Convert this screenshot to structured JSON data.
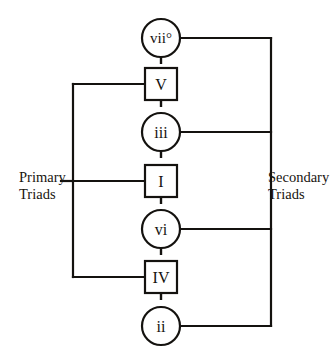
{
  "diagram": {
    "colors": {
      "line": "#14120f",
      "text": "#18150f",
      "background": "#ffffff",
      "node_fill": "#ffffff"
    },
    "nodes": [
      {
        "id": "vii-dim",
        "label": "vii°",
        "shape": "circle",
        "group": "secondary",
        "cx": 161,
        "cy": 38,
        "r": 19
      },
      {
        "id": "V",
        "label": "V",
        "shape": "rectangle",
        "group": "primary",
        "cx": 161,
        "cy": 84,
        "r": 16
      },
      {
        "id": "iii",
        "label": "iii",
        "shape": "circle",
        "group": "secondary",
        "cx": 161,
        "cy": 132,
        "r": 19
      },
      {
        "id": "I",
        "label": "I",
        "shape": "rectangle",
        "group": "primary",
        "cx": 161,
        "cy": 181,
        "r": 16
      },
      {
        "id": "vi",
        "label": "vi",
        "shape": "circle",
        "group": "secondary",
        "cx": 161,
        "cy": 229,
        "r": 19
      },
      {
        "id": "IV",
        "label": "IV",
        "shape": "rectangle",
        "group": "primary",
        "cx": 161,
        "cy": 277,
        "r": 16
      },
      {
        "id": "ii",
        "label": "ii",
        "shape": "circle",
        "group": "secondary",
        "cx": 161,
        "cy": 326,
        "r": 19
      }
    ],
    "connectors": [
      {
        "from": "vii-dim",
        "to": "V",
        "style": "dashed"
      },
      {
        "from": "V",
        "to": "iii",
        "style": "dashed"
      },
      {
        "from": "iii",
        "to": "I",
        "style": "dashed"
      },
      {
        "from": "I",
        "to": "vi",
        "style": "dashed"
      },
      {
        "from": "vi",
        "to": "IV",
        "style": "dashed"
      },
      {
        "from": "IV",
        "to": "ii",
        "style": "dashed"
      }
    ],
    "brackets": [
      {
        "id": "primary-bracket",
        "side": "left",
        "spine_x": 73,
        "top_y": 84,
        "bottom_y": 277,
        "members": [
          "V",
          "I",
          "IV"
        ],
        "stub_y": 181
      },
      {
        "id": "secondary-bracket",
        "side": "right",
        "spine_x": 271,
        "top_y": 38,
        "bottom_y": 326,
        "members": [
          "vii-dim",
          "iii",
          "vi",
          "ii"
        ],
        "stub_y": 132
      }
    ],
    "labels": {
      "primary": "Primary\nTriads",
      "secondary": "Secondary\nTriads"
    }
  }
}
